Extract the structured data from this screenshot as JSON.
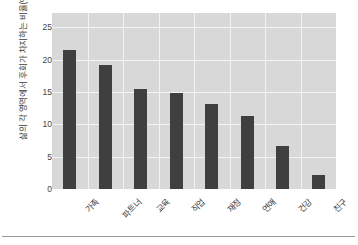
{
  "chart_data": {
    "type": "bar",
    "title": "",
    "subtitle": "",
    "xlabel": "",
    "ylabel": "삶의 각 영역에서 후회가 차지하는 비율(%)",
    "categories": [
      "가족",
      "파트너",
      "교육",
      "직업",
      "재정",
      "연애",
      "건강",
      "친구"
    ],
    "values": [
      21.5,
      19.1,
      15.4,
      14.9,
      13.2,
      11.3,
      6.7,
      2.2
    ],
    "ylim": [
      0,
      27.2
    ],
    "yticks": [
      0,
      5,
      10,
      15,
      20,
      25
    ],
    "ytick_labels": [
      "0",
      "5",
      "10",
      "15",
      "20",
      "25"
    ],
    "grid": true,
    "grid_color": "#f3f3f3",
    "legend": null,
    "legend_position": "none",
    "bar_color": "#3f3f3f",
    "plot_background": "#d8d8d8",
    "figure_background": "#ffffff",
    "annotations": []
  }
}
